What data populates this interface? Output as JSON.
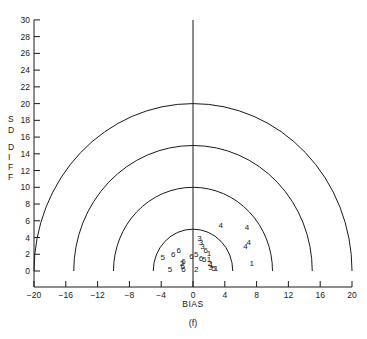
{
  "chart_data": {
    "type": "scatter",
    "title": "",
    "caption": "(f)",
    "xlabel": "BIAS",
    "ylabel": "SDIFF",
    "ylabel_letters": [
      "S",
      "D",
      "D",
      "I",
      "F",
      "F"
    ],
    "xlim": [
      -20,
      20
    ],
    "ylim": [
      0,
      30
    ],
    "xticks": [
      -20,
      -16,
      -12,
      -8,
      -4,
      0,
      4,
      8,
      12,
      16,
      20
    ],
    "yticks": [
      0,
      2,
      4,
      6,
      8,
      10,
      12,
      14,
      16,
      18,
      20,
      22,
      24,
      26,
      28,
      30
    ],
    "grid": false,
    "reference_line": {
      "x": 0,
      "y_from": 0,
      "y_to": 30
    },
    "semicircles": {
      "center": [
        0,
        0
      ],
      "radii": [
        5,
        10,
        15,
        20
      ]
    },
    "points_note": "Approximate positions; the cluster near the origin is dense and overlapping, so some marker labels and positions are uncertain.",
    "points": [
      {
        "label": "4",
        "x": 3.5,
        "y": 5.5
      },
      {
        "label": "4",
        "x": 6.8,
        "y": 5.3
      },
      {
        "label": "4",
        "x": 7.0,
        "y": 3.5
      },
      {
        "label": "4",
        "x": 6.6,
        "y": 3.0
      },
      {
        "label": "1",
        "x": 7.4,
        "y": 1.0
      },
      {
        "label": "3",
        "x": 0.8,
        "y": 4.0
      },
      {
        "label": "3",
        "x": 1.0,
        "y": 3.5
      },
      {
        "label": "3",
        "x": 1.2,
        "y": 3.0
      },
      {
        "label": "6",
        "x": 1.6,
        "y": 2.5
      },
      {
        "label": "1",
        "x": 2.0,
        "y": 2.2
      },
      {
        "label": "5",
        "x": 0.4,
        "y": 2.0
      },
      {
        "label": "6",
        "x": 1.0,
        "y": 1.6
      },
      {
        "label": "5",
        "x": 1.4,
        "y": 1.4
      },
      {
        "label": "1",
        "x": 2.0,
        "y": 1.4
      },
      {
        "label": "2",
        "x": 2.1,
        "y": 1.0
      },
      {
        "label": "1",
        "x": 2.3,
        "y": 0.8
      },
      {
        "label": "3",
        "x": 2.2,
        "y": 0.5
      },
      {
        "label": "5",
        "x": 2.6,
        "y": 0.3
      },
      {
        "label": "1",
        "x": 2.9,
        "y": 0.3
      },
      {
        "label": "5",
        "x": -3.8,
        "y": 1.7
      },
      {
        "label": "6",
        "x": -2.5,
        "y": 2.0
      },
      {
        "label": "6",
        "x": -1.8,
        "y": 2.5
      },
      {
        "label": "5",
        "x": -2.9,
        "y": 0.2
      },
      {
        "label": "6",
        "x": -1.2,
        "y": 1.2
      },
      {
        "label": "2",
        "x": -1.4,
        "y": 1.0
      },
      {
        "label": "6",
        "x": -1.3,
        "y": 0.6
      },
      {
        "label": "6",
        "x": -1.2,
        "y": 0.2
      },
      {
        "label": "6",
        "x": -0.2,
        "y": 1.8
      },
      {
        "label": "2",
        "x": 0.4,
        "y": 0.2
      }
    ],
    "colors": {
      "ink": "#1a1a1a",
      "background": "#ffffff"
    }
  }
}
